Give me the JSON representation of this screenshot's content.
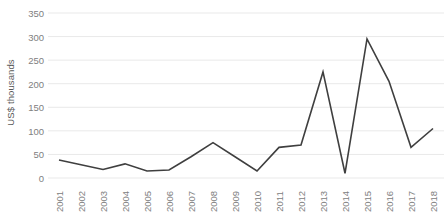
{
  "chart_data": {
    "type": "line",
    "title": "",
    "subtitle": "",
    "xlabel": "",
    "ylabel": "US$ thousands",
    "ylim": [
      0,
      350
    ],
    "ytick_step": 50,
    "yticks": [
      0,
      50,
      100,
      150,
      200,
      250,
      300,
      350
    ],
    "ytick_labels": [
      "0",
      "50",
      "100",
      "150",
      "200",
      "250",
      "300",
      "350"
    ],
    "grid": true,
    "grid_axis": "y",
    "legend": false,
    "legend_position": "none",
    "xtick_rotation": -90,
    "categories": [
      "2001",
      "2002",
      "2003",
      "2004",
      "2005",
      "2006",
      "2007",
      "2008",
      "2009",
      "2010",
      "2011",
      "2012",
      "2013",
      "2014",
      "2015",
      "2016",
      "2017",
      "2018"
    ],
    "values": [
      38,
      28,
      18,
      30,
      15,
      17,
      45,
      75,
      45,
      15,
      65,
      70,
      225,
      10,
      295,
      205,
      65,
      105
    ],
    "series": [
      {
        "name": "US$ thousands",
        "color": "#3f3f3f",
        "values": [
          38,
          28,
          18,
          30,
          15,
          17,
          45,
          75,
          45,
          15,
          65,
          70,
          225,
          10,
          295,
          205,
          65,
          105
        ]
      }
    ],
    "annotations": []
  },
  "style": {
    "line_color": "#3f3f3f",
    "grid_color": "#e9e9e9",
    "axis_label_color": "#808080",
    "axis_title_color": "#595959",
    "background": "#ffffff"
  }
}
